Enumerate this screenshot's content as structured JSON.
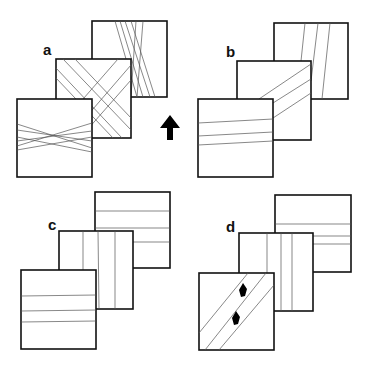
{
  "figure": {
    "arrow": {
      "icon": "up-arrow-icon",
      "direction": "up"
    },
    "colors": {
      "stroke": "#111111",
      "line": "#555555",
      "background": "#ffffff"
    },
    "panels": [
      {
        "label": "a",
        "pattern": "crossing oblique lines in all three sheets"
      },
      {
        "label": "b",
        "pattern": "parallel lines continuous across sheets at shifted angles"
      },
      {
        "label": "c",
        "pattern": "horizontal lines on back and front, vertical lines on middle"
      },
      {
        "label": "d",
        "pattern": "horizontal back, vertical middle, diagonal front with two dark marks"
      }
    ]
  }
}
